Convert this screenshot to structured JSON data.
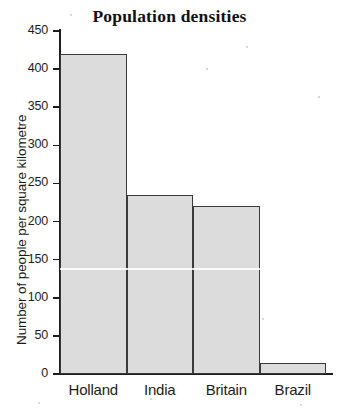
{
  "chart_data": {
    "type": "bar",
    "title": "Population densities",
    "xlabel": "",
    "ylabel": "Number of people per square kilometre",
    "categories": [
      "Holland",
      "India",
      "Britain",
      "Brazil"
    ],
    "values": [
      420,
      235,
      220,
      15
    ],
    "ylim": [
      0,
      450
    ],
    "yticks": [
      0,
      50,
      100,
      150,
      200,
      250,
      300,
      350,
      400,
      450
    ],
    "ytick_labels": [
      "0",
      "50",
      "100",
      "150",
      "200",
      "250",
      "300",
      "350",
      "400",
      "450"
    ],
    "grid": false,
    "legend": false,
    "bar_fill_color": "#dcdcdc",
    "bar_edge_color": "#3a3a3a",
    "axis_color": "#1c1c1c",
    "background_color": "#ffffff"
  }
}
